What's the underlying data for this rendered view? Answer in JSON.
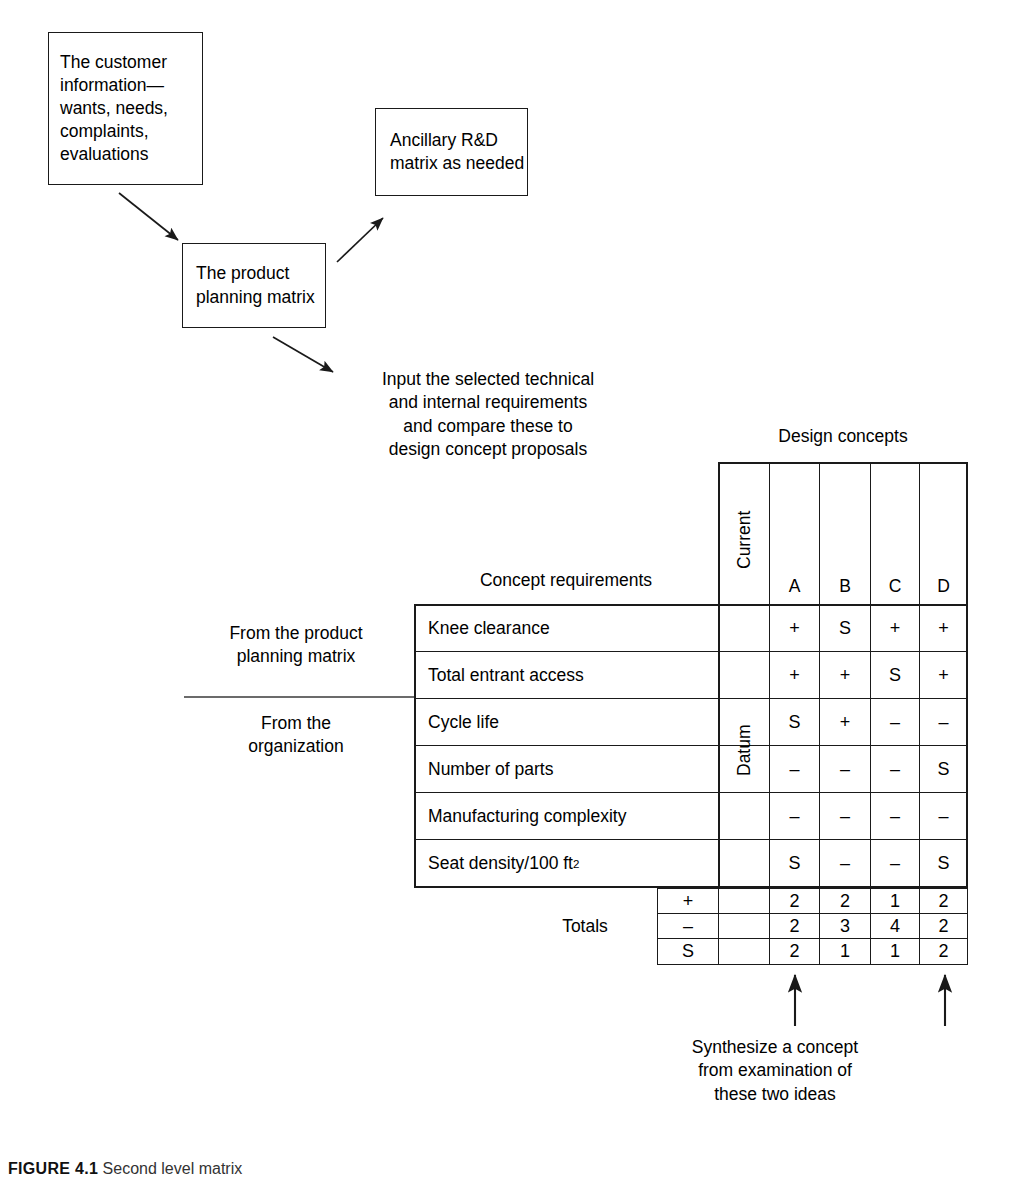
{
  "figure": {
    "caption_number": "FIGURE 4.1",
    "caption_text": "Second level matrix"
  },
  "flow": {
    "customer_box": "The customer\ninformation—\nwants, needs,\ncomplaints,\nevaluations",
    "ancillary_box": "Ancillary\nR&D matrix\nas needed",
    "planning_box": "The product\nplanning\nmatrix",
    "input_note": "Input the selected technical\nand internal requirements\nand compare these to\ndesign concept proposals"
  },
  "matrix": {
    "top_label": "Design concepts",
    "row_header_label": "Concept requirements",
    "datum_label": "Datum",
    "current_label": "Current",
    "concept_columns": [
      "A",
      "B",
      "C",
      "D"
    ],
    "rows": [
      {
        "requirement": "Knee clearance",
        "values": [
          "+",
          "S",
          "+",
          "+"
        ]
      },
      {
        "requirement": "Total entrant access",
        "values": [
          "+",
          "+",
          "S",
          "+"
        ]
      },
      {
        "requirement": "Cycle life",
        "values": [
          "S",
          "+",
          "–",
          "–"
        ]
      },
      {
        "requirement": "Number of parts",
        "values": [
          "–",
          "–",
          "–",
          "S"
        ]
      },
      {
        "requirement": "Manufacturing complexity",
        "values": [
          "–",
          "–",
          "–",
          "–"
        ]
      },
      {
        "requirement": "Seat density/100 ft",
        "requirement_sup": "2",
        "values": [
          "S",
          "–",
          "–",
          "S"
        ]
      }
    ],
    "totals_label": "Totals",
    "totals_rows": [
      {
        "sign": "+",
        "values": [
          "2",
          "2",
          "1",
          "2"
        ]
      },
      {
        "sign": "–",
        "values": [
          "2",
          "3",
          "4",
          "2"
        ]
      },
      {
        "sign": "S",
        "values": [
          "2",
          "1",
          "1",
          "2"
        ]
      }
    ]
  },
  "annotations": {
    "from_product_planning": "From the product\nplanning matrix",
    "from_organization": "From the\norganization",
    "synthesize_note": "Synthesize a concept\nfrom examination of\nthese two ideas"
  },
  "colors": {
    "ink": "#1a1a1a",
    "background": "#ffffff"
  }
}
